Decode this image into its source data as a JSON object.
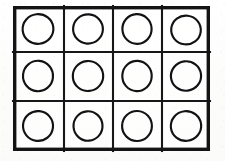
{
  "figure": {
    "rows": 3,
    "columns": 4,
    "cell_count": 12,
    "shape_per_cell": "circle",
    "colors": {
      "background": "#fdfdfc",
      "line": "#17171a",
      "outer_border": "#141417",
      "circle_stroke": "#121215",
      "cell_fill": "#ffffff"
    },
    "geometry": {
      "outer_left": 13,
      "outer_top": 6,
      "outer_width": 197,
      "outer_height": 145,
      "outer_stroke_width": 3.4,
      "inner_stroke_width": 2.1,
      "circle_stroke_width": 2.15,
      "column_dividers_x": [
        51,
        100,
        149
      ],
      "row_dividers_y": [
        46,
        95
      ]
    },
    "cells": [
      {
        "id": "cell-r1c1",
        "row": 1,
        "column": 1,
        "shape": "circle",
        "cx": 25,
        "cy": 23,
        "rx": 15.4,
        "ry": 14.8,
        "rotation": -6
      },
      {
        "id": "cell-r1c2",
        "row": 1,
        "column": 2,
        "shape": "circle",
        "cx": 75,
        "cy": 23,
        "rx": 14.9,
        "ry": 14.6,
        "rotation": 4
      },
      {
        "id": "cell-r1c3",
        "row": 1,
        "column": 3,
        "shape": "circle",
        "cx": 124,
        "cy": 23,
        "rx": 14.6,
        "ry": 14.9,
        "rotation": -3
      },
      {
        "id": "cell-r1c4",
        "row": 1,
        "column": 4,
        "shape": "circle",
        "cx": 173,
        "cy": 24,
        "rx": 14.8,
        "ry": 14.4,
        "rotation": 7
      },
      {
        "id": "cell-r2c1",
        "row": 2,
        "column": 1,
        "shape": "circle",
        "cx": 25,
        "cy": 70,
        "rx": 15.0,
        "ry": 15.2,
        "rotation": 5
      },
      {
        "id": "cell-r2c2",
        "row": 2,
        "column": 2,
        "shape": "circle",
        "cx": 75,
        "cy": 70,
        "rx": 15.2,
        "ry": 15.0,
        "rotation": -5
      },
      {
        "id": "cell-r2c3",
        "row": 2,
        "column": 3,
        "shape": "circle",
        "cx": 124,
        "cy": 70,
        "rx": 14.7,
        "ry": 15.1,
        "rotation": 3
      },
      {
        "id": "cell-r2c4",
        "row": 2,
        "column": 4,
        "shape": "circle",
        "cx": 173,
        "cy": 70,
        "rx": 15.1,
        "ry": 14.7,
        "rotation": -7
      },
      {
        "id": "cell-r3c1",
        "row": 3,
        "column": 1,
        "shape": "circle",
        "cx": 25,
        "cy": 120,
        "rx": 15.0,
        "ry": 14.9,
        "rotation": 6
      },
      {
        "id": "cell-r3c2",
        "row": 3,
        "column": 2,
        "shape": "circle",
        "cx": 75,
        "cy": 120,
        "rx": 14.5,
        "ry": 14.7,
        "rotation": -4
      },
      {
        "id": "cell-r3c3",
        "row": 3,
        "column": 3,
        "shape": "circle",
        "cx": 124,
        "cy": 120,
        "rx": 14.9,
        "ry": 15.0,
        "rotation": 2
      },
      {
        "id": "cell-r3c4",
        "row": 3,
        "column": 4,
        "shape": "circle",
        "cx": 173,
        "cy": 120,
        "rx": 15.2,
        "ry": 14.8,
        "rotation": -6
      }
    ]
  }
}
